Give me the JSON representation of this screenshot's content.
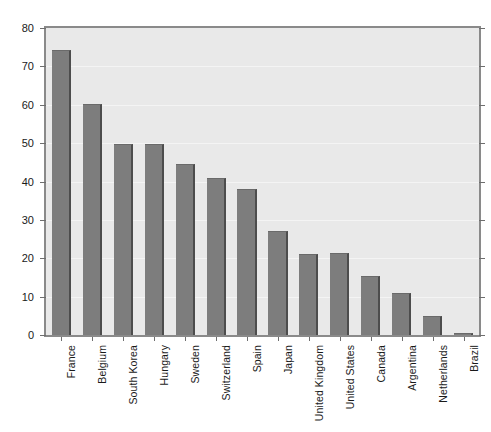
{
  "chart_data": {
    "type": "bar",
    "title": "",
    "subtitle": "",
    "xlabel": "",
    "ylabel": "",
    "ylim": [
      0,
      80
    ],
    "ytick_values": [
      0,
      10,
      20,
      30,
      40,
      50,
      60,
      70,
      80
    ],
    "ytick_labels": [
      "0",
      "10",
      "20",
      "30",
      "40",
      "50",
      "60",
      "70",
      "80"
    ],
    "grid": true,
    "legend": "none",
    "categories": [
      "France",
      "Belgium",
      "South Korea",
      "Hungary",
      "Sweden",
      "Switzerland",
      "Spain",
      "Japan",
      "United Kingdom",
      "United States",
      "Canada",
      "Argentina",
      "Netherlands",
      "Brazil"
    ],
    "values": [
      74.2,
      60.3,
      49.8,
      49.7,
      44.5,
      41.0,
      38.0,
      27.0,
      21.0,
      21.3,
      15.3,
      11.0,
      5.0,
      0.4
    ],
    "bar_color": "#7d7d7d",
    "bar_edge_color": "#4d4d4d",
    "plot_background": "#e9e9e9",
    "axis_color": "#8a8a8a",
    "gridline_color": "#f4f4f4",
    "text_color": "#1a1a1a"
  }
}
